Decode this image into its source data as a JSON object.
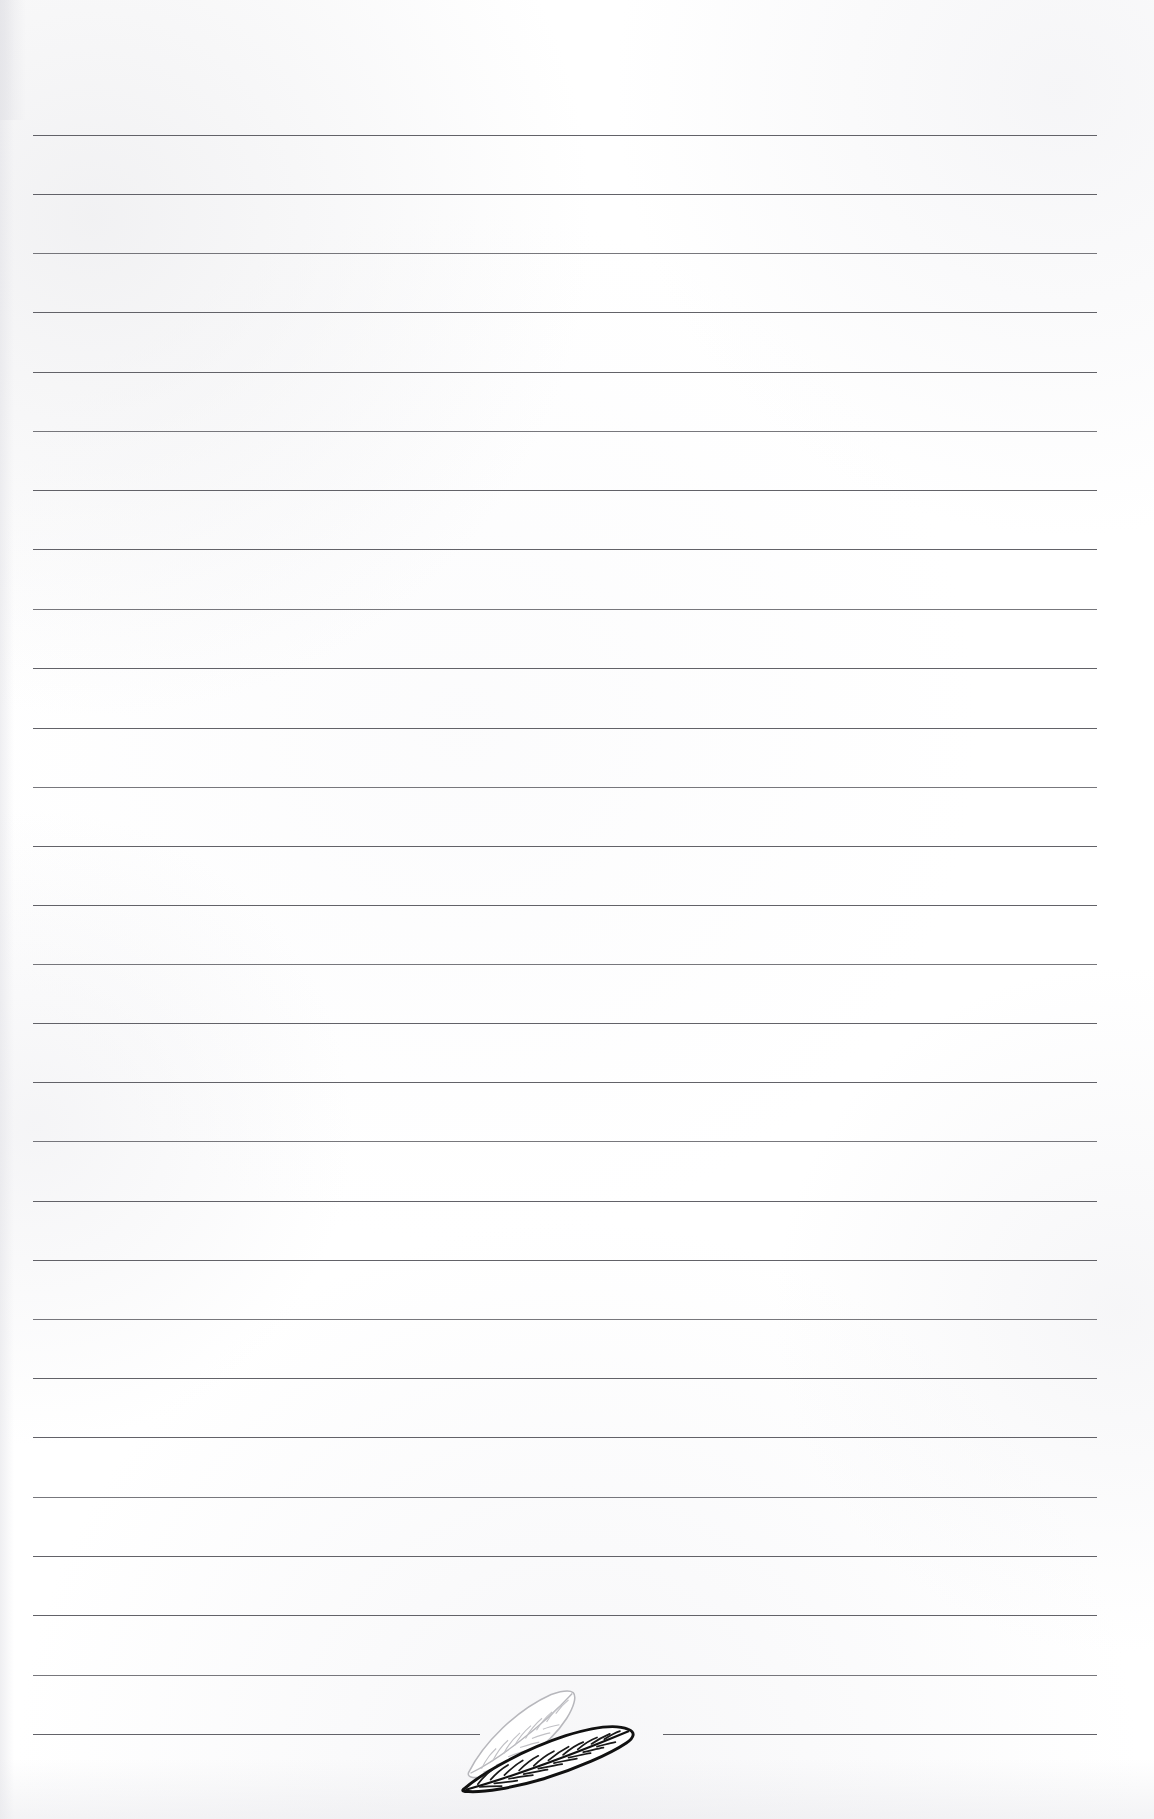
{
  "page": {
    "width": 1154,
    "height": 1819,
    "background_color": "#ffffff",
    "paper_type": "ruled-notepaper",
    "text_content": "",
    "is_blank": true
  },
  "ruling": {
    "line_color": "#55555b",
    "line_thickness_px": 1.4,
    "line_count": 28,
    "left_margin_px": 33,
    "right_margin_px": 1097,
    "first_line_y_px": 135,
    "line_spacing_px": 59.2,
    "lines": [
      {
        "index": 1,
        "y": 135,
        "x_start": 33,
        "x_end": 1097,
        "interrupted": false
      },
      {
        "index": 2,
        "y": 194,
        "x_start": 33,
        "x_end": 1097,
        "interrupted": false
      },
      {
        "index": 3,
        "y": 253,
        "x_start": 33,
        "x_end": 1097,
        "interrupted": false
      },
      {
        "index": 4,
        "y": 312,
        "x_start": 33,
        "x_end": 1097,
        "interrupted": false
      },
      {
        "index": 5,
        "y": 372,
        "x_start": 33,
        "x_end": 1097,
        "interrupted": false
      },
      {
        "index": 6,
        "y": 431,
        "x_start": 33,
        "x_end": 1097,
        "interrupted": false
      },
      {
        "index": 7,
        "y": 490,
        "x_start": 33,
        "x_end": 1097,
        "interrupted": false
      },
      {
        "index": 8,
        "y": 549,
        "x_start": 33,
        "x_end": 1097,
        "interrupted": false
      },
      {
        "index": 9,
        "y": 609,
        "x_start": 33,
        "x_end": 1097,
        "interrupted": false
      },
      {
        "index": 10,
        "y": 668,
        "x_start": 33,
        "x_end": 1097,
        "interrupted": false
      },
      {
        "index": 11,
        "y": 728,
        "x_start": 33,
        "x_end": 1097,
        "interrupted": false
      },
      {
        "index": 12,
        "y": 787,
        "x_start": 33,
        "x_end": 1097,
        "interrupted": false
      },
      {
        "index": 13,
        "y": 846,
        "x_start": 33,
        "x_end": 1097,
        "interrupted": false
      },
      {
        "index": 14,
        "y": 905,
        "x_start": 33,
        "x_end": 1097,
        "interrupted": false
      },
      {
        "index": 15,
        "y": 964,
        "x_start": 33,
        "x_end": 1097,
        "interrupted": false
      },
      {
        "index": 16,
        "y": 1023,
        "x_start": 33,
        "x_end": 1097,
        "interrupted": false
      },
      {
        "index": 17,
        "y": 1082,
        "x_start": 33,
        "x_end": 1097,
        "interrupted": false
      },
      {
        "index": 18,
        "y": 1141,
        "x_start": 33,
        "x_end": 1097,
        "interrupted": false
      },
      {
        "index": 19,
        "y": 1201,
        "x_start": 33,
        "x_end": 1097,
        "interrupted": false
      },
      {
        "index": 20,
        "y": 1260,
        "x_start": 33,
        "x_end": 1097,
        "interrupted": false
      },
      {
        "index": 21,
        "y": 1319,
        "x_start": 33,
        "x_end": 1097,
        "interrupted": false
      },
      {
        "index": 22,
        "y": 1378,
        "x_start": 33,
        "x_end": 1097,
        "interrupted": false
      },
      {
        "index": 23,
        "y": 1437,
        "x_start": 33,
        "x_end": 1097,
        "interrupted": false
      },
      {
        "index": 24,
        "y": 1497,
        "x_start": 33,
        "x_end": 1097,
        "interrupted": false
      },
      {
        "index": 25,
        "y": 1556,
        "x_start": 33,
        "x_end": 1097,
        "interrupted": false
      },
      {
        "index": 26,
        "y": 1615,
        "x_start": 33,
        "x_end": 1097,
        "interrupted": false
      },
      {
        "index": 27,
        "y": 1675,
        "x_start": 33,
        "x_end": 1097,
        "interrupted": false
      },
      {
        "index": 28,
        "y": 1734,
        "x_start": 33,
        "x_end": 480,
        "x_start_2": 663,
        "x_end_2": 1097,
        "interrupted": true
      }
    ]
  },
  "ornament": {
    "name": "leaf-ornament",
    "description": "Two overlapping pointed leaves with herringbone veins, angled up to the right, breaking the final ruled line",
    "position": {
      "x": 455,
      "y": 1688,
      "width": 185,
      "height": 110
    },
    "leaves": [
      {
        "label": "back-leaf",
        "style": "outline",
        "stroke_color": "#b9b9bd",
        "fill_color": "#ffffff",
        "vein_count": 9
      },
      {
        "label": "front-leaf",
        "style": "bold-outline",
        "stroke_color": "#111111",
        "fill_color": "#ffffff",
        "vein_count": 11
      }
    ]
  }
}
